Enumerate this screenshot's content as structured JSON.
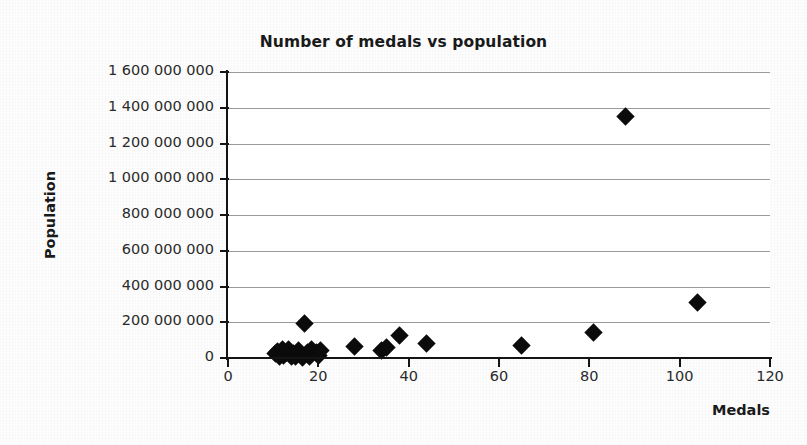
{
  "chart_data": {
    "type": "scatter",
    "title": "Number of medals vs population",
    "xlabel": "Medals",
    "ylabel": "Population",
    "xlim": [
      0,
      120
    ],
    "ylim": [
      0,
      1600000000
    ],
    "x_ticks": [
      0,
      20,
      40,
      60,
      80,
      100,
      120
    ],
    "x_tick_labels": [
      "0",
      "20",
      "40",
      "60",
      "80",
      "100",
      "120"
    ],
    "y_ticks": [
      0,
      200000000,
      400000000,
      600000000,
      800000000,
      1000000000,
      1200000000,
      1400000000,
      1600000000
    ],
    "y_tick_labels": [
      "0",
      "200 000 000",
      "400 000 000",
      "600 000 000",
      "800 000 000",
      "1 000 000 000",
      "1 200 000 000",
      "1 400 000 000",
      "1 600 000 000"
    ],
    "grid": "horizontal",
    "legend": "none",
    "marker": "diamond",
    "marker_color": "#0b0b0b",
    "points": [
      {
        "x": 10.5,
        "y": 23000000
      },
      {
        "x": 11,
        "y": 38000000
      },
      {
        "x": 11.5,
        "y": 9000000
      },
      {
        "x": 12,
        "y": 50000000
      },
      {
        "x": 12.3,
        "y": 16000000
      },
      {
        "x": 13,
        "y": 31000000
      },
      {
        "x": 13.5,
        "y": 46000000
      },
      {
        "x": 14,
        "y": 11000000
      },
      {
        "x": 14.5,
        "y": 27000000
      },
      {
        "x": 15,
        "y": 8000000
      },
      {
        "x": 15.5,
        "y": 40000000
      },
      {
        "x": 16,
        "y": 20000000
      },
      {
        "x": 16.5,
        "y": 5000000
      },
      {
        "x": 17,
        "y": 195000000
      },
      {
        "x": 17.5,
        "y": 33000000
      },
      {
        "x": 18,
        "y": 10000000
      },
      {
        "x": 18.5,
        "y": 48000000
      },
      {
        "x": 19.5,
        "y": 29000000
      },
      {
        "x": 20,
        "y": 12000000
      },
      {
        "x": 20.5,
        "y": 42000000
      },
      {
        "x": 28,
        "y": 62000000
      },
      {
        "x": 34,
        "y": 40000000
      },
      {
        "x": 35,
        "y": 60000000
      },
      {
        "x": 38,
        "y": 127000000
      },
      {
        "x": 44,
        "y": 82000000
      },
      {
        "x": 65,
        "y": 70000000
      },
      {
        "x": 81,
        "y": 143000000
      },
      {
        "x": 88,
        "y": 1350000000
      },
      {
        "x": 104,
        "y": 313000000
      }
    ]
  }
}
